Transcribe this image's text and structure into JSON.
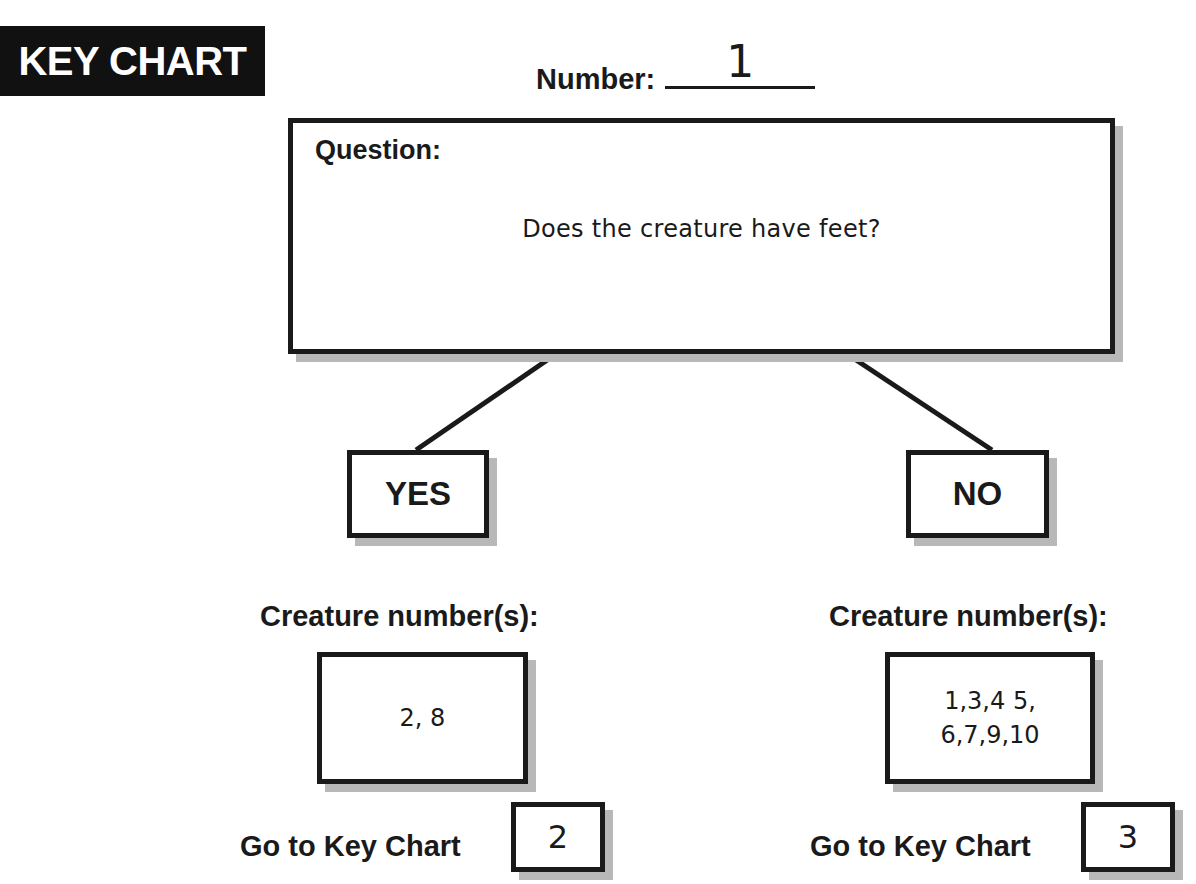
{
  "header": {
    "badge_label": "KEY CHART",
    "number_label": "Number:",
    "number_value": "1"
  },
  "question": {
    "label": "Question:",
    "text": "Does the creature have feet?"
  },
  "branches": {
    "yes": {
      "label": "YES",
      "creature_label": "Creature number(s):",
      "creature_numbers": "2, 8",
      "goto_label": "Go to Key Chart",
      "goto_value": "2"
    },
    "no": {
      "label": "NO",
      "creature_label": "Creature number(s):",
      "creature_numbers": "1,3,4 5,\n6,7,9,10",
      "goto_label": "Go to Key Chart",
      "goto_value": "3"
    }
  },
  "colors": {
    "ink": "#1a1a1a",
    "badge_bg": "#111111",
    "shadow": "#b8b8b8",
    "page_bg": "#ffffff"
  }
}
